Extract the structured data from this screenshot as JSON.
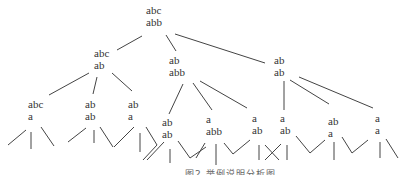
{
  "diagram": {
    "type": "tree",
    "nodes": [
      {
        "id": "root",
        "top": "abc",
        "bottom": "abb",
        "x": 146,
        "y": 4
      },
      {
        "id": "n1",
        "top": "abc",
        "bottom": "ab",
        "x": 94,
        "y": 48
      },
      {
        "id": "n2",
        "top": "ab",
        "bottom": "abb",
        "x": 169,
        "y": 55
      },
      {
        "id": "n3",
        "top": "ab",
        "bottom": "ab",
        "x": 274,
        "y": 55
      },
      {
        "id": "n1a",
        "top": "abc",
        "bottom": "a",
        "x": 29,
        "y": 99
      },
      {
        "id": "n1b",
        "top": "ab",
        "bottom": "ab",
        "x": 85,
        "y": 99
      },
      {
        "id": "n1c",
        "top": "ab",
        "bottom": "a",
        "x": 128,
        "y": 99
      },
      {
        "id": "n2a",
        "top": "ab",
        "bottom": "ab",
        "x": 163,
        "y": 116
      },
      {
        "id": "n2b",
        "top": "a",
        "bottom": "abb",
        "x": 206,
        "y": 113
      },
      {
        "id": "n2c",
        "top": "a",
        "bottom": "ab",
        "x": 252,
        "y": 112
      },
      {
        "id": "n3a",
        "top": "a",
        "bottom": "ab",
        "x": 280,
        "y": 112
      },
      {
        "id": "n3b",
        "top": "ab",
        "bottom": "a",
        "x": 328,
        "y": 116
      },
      {
        "id": "n3c",
        "top": "a",
        "bottom": "a",
        "x": 375,
        "y": 112
      }
    ]
  },
  "caption": "图2 举例说明分析图"
}
